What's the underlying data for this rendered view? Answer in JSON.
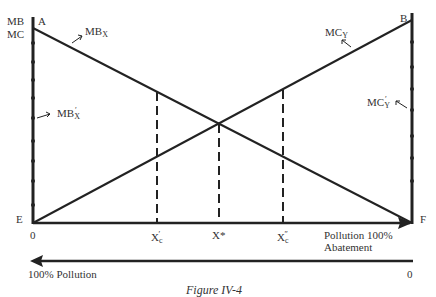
{
  "figure": {
    "caption": "Figure IV-4",
    "axis_left_label_top": "MB",
    "axis_left_label_bottom": "MC",
    "points": {
      "A": "A",
      "B": "B",
      "E": "E",
      "F": "F"
    },
    "curves": {
      "mbx": {
        "base": "MB",
        "sub": "X"
      },
      "mbx_prime": {
        "base": "MB",
        "sub": "X",
        "prime": "′"
      },
      "mcy": {
        "base": "MC",
        "sub": "Y"
      },
      "mcy_prime": {
        "base": "MC",
        "sub": "Y",
        "prime": "′"
      }
    },
    "x_ticks": {
      "origin": "0",
      "xc_prime": {
        "base": "X",
        "sub": "c",
        "prime": "′"
      },
      "xstar": "X*",
      "xc_dprime": {
        "base": "X",
        "sub": "c",
        "prime": "″"
      },
      "end_line1": "Pollution 100%",
      "end_line2": "Abatement"
    },
    "lower_axis": {
      "left": "100% Pollution",
      "right": "0"
    }
  }
}
